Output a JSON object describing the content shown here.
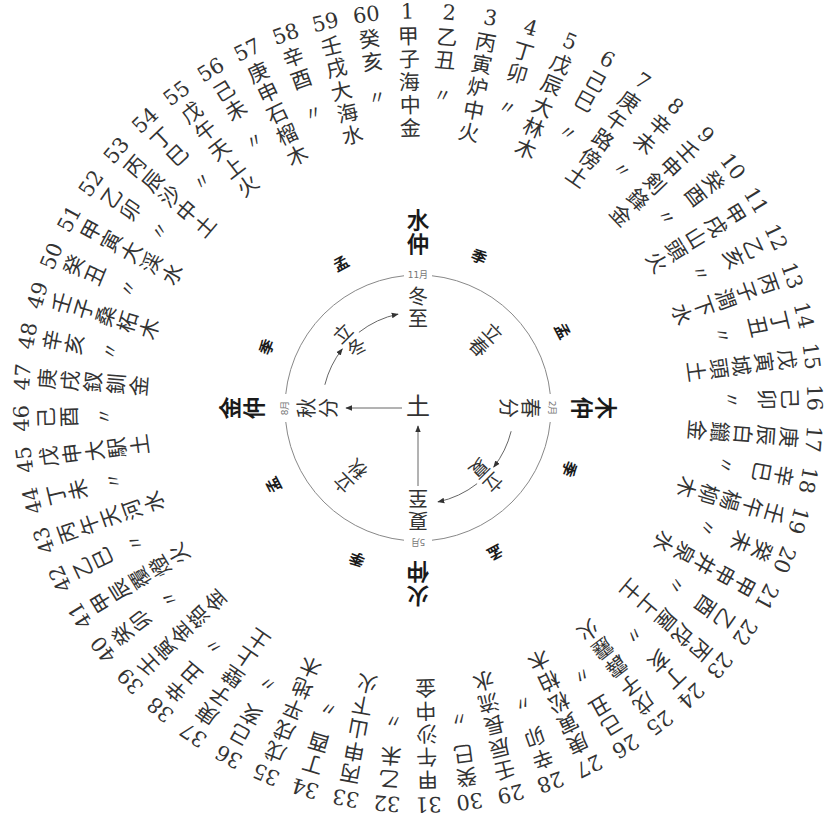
{
  "diagram": {
    "center": {
      "x": 418,
      "y": 408
    },
    "outer_ring": {
      "entries": [
        {
          "n": "1",
          "gz": "甲子",
          "ny": "海中金"
        },
        {
          "n": "2",
          "gz": "乙丑",
          "ny": "〃"
        },
        {
          "n": "3",
          "gz": "丙寅",
          "ny": "炉中火"
        },
        {
          "n": "4",
          "gz": "丁卯",
          "ny": "〃"
        },
        {
          "n": "5",
          "gz": "戊辰",
          "ny": "大林木"
        },
        {
          "n": "6",
          "gz": "己巳",
          "ny": "〃"
        },
        {
          "n": "7",
          "gz": "庚午",
          "ny": "路傍土"
        },
        {
          "n": "8",
          "gz": "辛未",
          "ny": "〃"
        },
        {
          "n": "9",
          "gz": "壬申",
          "ny": "剣鋒金"
        },
        {
          "n": "10",
          "gz": "癸酉",
          "ny": "〃"
        },
        {
          "n": "11",
          "gz": "甲戌",
          "ny": "山頭火"
        },
        {
          "n": "12",
          "gz": "乙亥",
          "ny": "〃"
        },
        {
          "n": "13",
          "gz": "丙子",
          "ny": "澗下水"
        },
        {
          "n": "14",
          "gz": "丁丑",
          "ny": "〃"
        },
        {
          "n": "15",
          "gz": "戊寅",
          "ny": "城頭土"
        },
        {
          "n": "16",
          "gz": "己卯",
          "ny": "〃"
        },
        {
          "n": "17",
          "gz": "庚辰",
          "ny": "白鑞金"
        },
        {
          "n": "18",
          "gz": "辛巳",
          "ny": "〃"
        },
        {
          "n": "19",
          "gz": "壬午",
          "ny": "楊柳木"
        },
        {
          "n": "20",
          "gz": "癸未",
          "ny": "〃"
        },
        {
          "n": "21",
          "gz": "甲申",
          "ny": "井泉水"
        },
        {
          "n": "22",
          "gz": "乙酉",
          "ny": "〃"
        },
        {
          "n": "23",
          "gz": "丙戌",
          "ny": "屋上土"
        },
        {
          "n": "24",
          "gz": "丁亥",
          "ny": "〃"
        },
        {
          "n": "25",
          "gz": "戊子",
          "ny": "霹靂火"
        },
        {
          "n": "26",
          "gz": "己丑",
          "ny": "〃"
        },
        {
          "n": "27",
          "gz": "庚寅",
          "ny": "松柏木"
        },
        {
          "n": "28",
          "gz": "辛卯",
          "ny": "〃"
        },
        {
          "n": "29",
          "gz": "壬辰",
          "ny": "長流水"
        },
        {
          "n": "30",
          "gz": "癸巳",
          "ny": "〃"
        },
        {
          "n": "31",
          "gz": "甲午",
          "ny": "沙中金"
        },
        {
          "n": "32",
          "gz": "乙未",
          "ny": "〃"
        },
        {
          "n": "33",
          "gz": "丙申",
          "ny": "山下火"
        },
        {
          "n": "34",
          "gz": "丁酉",
          "ny": "〃"
        },
        {
          "n": "35",
          "gz": "戊戌",
          "ny": "平地木"
        },
        {
          "n": "36",
          "gz": "己亥",
          "ny": "〃"
        },
        {
          "n": "37",
          "gz": "庚子",
          "ny": "壁上土"
        },
        {
          "n": "38",
          "gz": "辛丑",
          "ny": "〃"
        },
        {
          "n": "39",
          "gz": "壬寅",
          "ny": "金箔金"
        },
        {
          "n": "40",
          "gz": "癸卯",
          "ny": "〃"
        },
        {
          "n": "41",
          "gz": "甲辰",
          "ny": "覆燈火"
        },
        {
          "n": "42",
          "gz": "乙巳",
          "ny": "〃"
        },
        {
          "n": "43",
          "gz": "丙午",
          "ny": "天河水"
        },
        {
          "n": "44",
          "gz": "丁未",
          "ny": "〃"
        },
        {
          "n": "45",
          "gz": "戊申",
          "ny": "大駅土"
        },
        {
          "n": "46",
          "gz": "己酉",
          "ny": "〃"
        },
        {
          "n": "47",
          "gz": "庚戌",
          "ny": "釵釧金"
        },
        {
          "n": "48",
          "gz": "辛亥",
          "ny": "〃"
        },
        {
          "n": "49",
          "gz": "壬子",
          "ny": "桑柘木"
        },
        {
          "n": "50",
          "gz": "癸丑",
          "ny": "〃"
        },
        {
          "n": "51",
          "gz": "甲寅",
          "ny": "大渓水"
        },
        {
          "n": "52",
          "gz": "乙卯",
          "ny": "〃"
        },
        {
          "n": "53",
          "gz": "丙辰",
          "ny": "沙中土"
        },
        {
          "n": "54",
          "gz": "丁巳",
          "ny": "〃"
        },
        {
          "n": "55",
          "gz": "戊午",
          "ny": "天上火"
        },
        {
          "n": "56",
          "gz": "己未",
          "ny": "〃"
        },
        {
          "n": "57",
          "gz": "庚申",
          "ny": "石榴木"
        },
        {
          "n": "58",
          "gz": "辛酉",
          "ny": "〃"
        },
        {
          "n": "59",
          "gz": "壬戌",
          "ny": "大海水"
        },
        {
          "n": "60",
          "gz": "癸亥",
          "ny": "〃"
        }
      ]
    },
    "cardinals": [
      {
        "id": "north",
        "label": "水仲",
        "month": "11月",
        "term": "冬至",
        "angle": 0
      },
      {
        "id": "east",
        "label": "木仲",
        "month": "2月",
        "term": "春分",
        "angle": 90
      },
      {
        "id": "south",
        "label": "火仲",
        "month": "5月",
        "term": "夏至",
        "angle": 180
      },
      {
        "id": "west",
        "label": "金仲",
        "month": "8月",
        "term": "秋分",
        "angle": 270
      }
    ],
    "intercardinal_terms": [
      {
        "label": "立春",
        "angle": 45
      },
      {
        "label": "立夏",
        "angle": 135
      },
      {
        "label": "立秋",
        "angle": 225
      },
      {
        "label": "立冬",
        "angle": 315
      }
    ],
    "season_markers": [
      {
        "label": "季",
        "angle": 22
      },
      {
        "label": "孟",
        "angle": 62
      },
      {
        "label": "季",
        "angle": 112
      },
      {
        "label": "孟",
        "angle": 152
      },
      {
        "label": "季",
        "angle": 202
      },
      {
        "label": "孟",
        "angle": 242
      },
      {
        "label": "季",
        "angle": 292
      },
      {
        "label": "孟",
        "angle": 332
      }
    ],
    "center_label": "土",
    "colors": {
      "text": "#333333",
      "bold": "#1a1a1a",
      "line": "#888888",
      "month": "#777777"
    }
  }
}
